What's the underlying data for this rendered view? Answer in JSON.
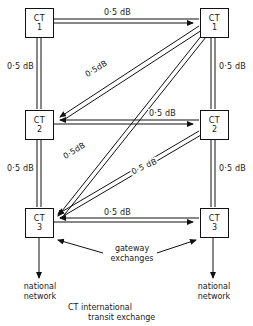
{
  "diagram": {
    "caption_line1": "CT   international",
    "caption_line2": "transit exchange",
    "gateway_line1": "gateway",
    "gateway_line2": "exchanges",
    "national_line1": "national",
    "national_line2": "network",
    "ct_text": "CT",
    "nodes": [
      {
        "id": "ct1-left",
        "ct": "CT",
        "number": "1",
        "x": 25,
        "y": 8,
        "side": "left"
      },
      {
        "id": "ct1-right",
        "ct": "CT",
        "number": "1",
        "x": 200,
        "y": 8,
        "side": "right"
      },
      {
        "id": "ct2-left",
        "ct": "CT",
        "number": "2",
        "x": 25,
        "y": 110,
        "side": "left"
      },
      {
        "id": "ct2-right",
        "ct": "CT",
        "number": "2",
        "x": 200,
        "y": 110,
        "side": "right"
      },
      {
        "id": "ct3-left",
        "ct": "CT",
        "number": "3",
        "x": 25,
        "y": 208,
        "side": "left"
      },
      {
        "id": "ct3-right",
        "ct": "CT",
        "number": "3",
        "x": 200,
        "y": 208,
        "side": "right"
      }
    ],
    "links": [
      {
        "id": "top-horizontal",
        "from": "ct1-left",
        "to": "ct1-right",
        "label": "0·5 dB"
      },
      {
        "id": "left-upper",
        "from": "ct1-left",
        "to": "ct2-left",
        "label": "0·5 dB"
      },
      {
        "id": "left-lower",
        "from": "ct2-left",
        "to": "ct3-left",
        "label": "0·5 dB"
      },
      {
        "id": "right-upper",
        "from": "ct1-right",
        "to": "ct2-right",
        "label": "0·5 dB"
      },
      {
        "id": "right-lower",
        "from": "ct2-right",
        "to": "ct3-right",
        "label": "0·5 dB"
      },
      {
        "id": "middle-horizontal",
        "from": "ct2-left",
        "to": "ct2-right",
        "label": "0·5 dB"
      },
      {
        "id": "bottom-horizontal",
        "from": "ct3-left",
        "to": "ct3-right",
        "label": "0·5 dB"
      },
      {
        "id": "diag-ct1r-ct2l",
        "from": "ct1-right",
        "to": "ct2-left",
        "label": "0·5dB"
      },
      {
        "id": "diag-ct1r-ct3l",
        "from": "ct1-right",
        "to": "ct3-left",
        "label": "0·5dB"
      },
      {
        "id": "diag-ct2r-ct3l",
        "from": "ct2-right",
        "to": "ct3-left",
        "label": "0·5 dB"
      }
    ],
    "labels": {
      "top": "0·5 dB",
      "left_upper": "0·5 dB",
      "left_lower": "0·5 dB",
      "right_upper": "0·5 dB",
      "right_lower": "0·5 dB",
      "middle": "0·5 dB",
      "bottom": "0·5 dB",
      "diag_upper": "0·5dB",
      "diag_lower": "0·5dB",
      "diag_mid": "0·5 dB"
    }
  }
}
